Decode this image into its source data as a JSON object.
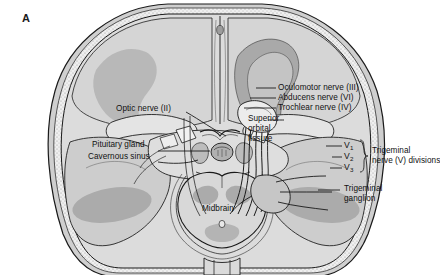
{
  "figure": {
    "panel_letter": "A",
    "type": "axial cranial anatomy illustration",
    "background_color": "#ffffff",
    "line_color": "#1a1a1a",
    "palette": {
      "skull_outer": "#d9d9d9",
      "skull_diploe": "#efefef",
      "brain_light": "#d2d2d2",
      "brain_mid": "#bdbdbd",
      "brain_dark": "#a5a5a5",
      "bone_pale": "#e6e6e6",
      "cavity_white": "#f4f4f4"
    }
  },
  "labels": {
    "oculomotor": "Oculomotor nerve (III)",
    "abducens": "Abducens nerve (VI)",
    "trochlear": "Trochlear nerve (IV)",
    "superior_orbital_fissure_line1": "Superior",
    "superior_orbital_fissure_line2": "orbital",
    "superior_orbital_fissure_line3": "fissure",
    "optic": "Optic nerve (II)",
    "pituitary": "Pituitary gland",
    "cavernous_sinus": "Cavernous sinus",
    "midbrain": "Midbrain",
    "trigeminal_divisions_line1": "Trigeminal",
    "trigeminal_divisions_line2": "nerve (V) divisions",
    "trigeminal_ganglion_line1": "Trigeminal",
    "trigeminal_ganglion_line2": "ganglion",
    "v1": "V",
    "v1_sub": "1",
    "v2": "V",
    "v2_sub": "2",
    "v3": "V",
    "v3_sub": "3"
  }
}
